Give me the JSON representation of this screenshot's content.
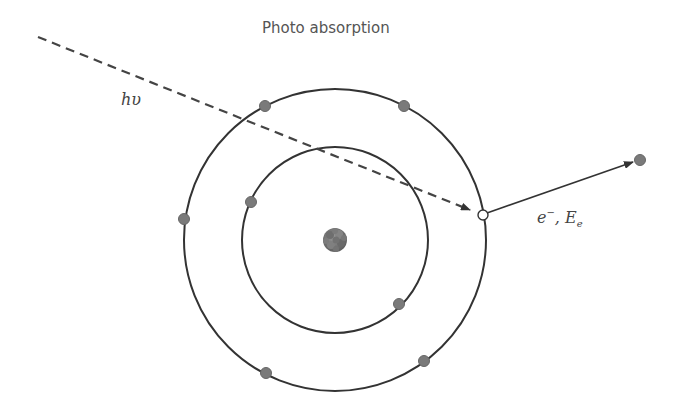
{
  "diagram": {
    "title": "Photo absorption",
    "photon_label": "hυ",
    "electron_label": {
      "symbol": "e",
      "charge": "−",
      "separator": ", ",
      "energy_symbol": "E",
      "energy_subscript": "e"
    },
    "atom": {
      "center": [
        335,
        240
      ],
      "nucleus_radius": 12,
      "shells": [
        {
          "name": "inner",
          "radius": 93,
          "electrons": [
            [
              251,
              202
            ],
            [
              399,
              304
            ]
          ]
        },
        {
          "name": "outer",
          "radius": 151,
          "electrons": [
            [
              265,
              106
            ],
            [
              404,
              106
            ],
            [
              184,
              219
            ],
            [
              266,
              373
            ],
            [
              424,
              361
            ]
          ]
        }
      ],
      "vacancy": [
        483,
        215
      ]
    },
    "incident_photon": {
      "from": [
        38,
        37
      ],
      "to": [
        472,
        211
      ],
      "style": "dashed"
    },
    "ejected_electron": {
      "from": [
        483,
        215
      ],
      "to": [
        635,
        162
      ],
      "position": [
        640,
        160
      ]
    },
    "colors": {
      "line": "#333333",
      "electron_fill": "#7a7a7a",
      "electron_stroke": "#666666",
      "nucleus": "#777777",
      "vacancy_fill": "#ffffff",
      "text": "#555555"
    }
  }
}
